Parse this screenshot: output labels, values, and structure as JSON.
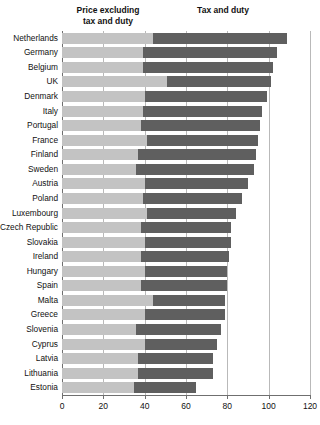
{
  "chart_data": {
    "type": "bar",
    "orientation": "horizontal",
    "stacked": true,
    "title": "",
    "xlabel": "",
    "ylabel": "",
    "xlim": [
      0,
      120
    ],
    "xticks": [
      0,
      20,
      40,
      60,
      80,
      100,
      120
    ],
    "grid": "vertical",
    "legend_position": "top-as-column-headers",
    "colors": {
      "price": "#c3c3c3",
      "tax": "#5f5f5f"
    },
    "series": [
      {
        "name": "Price excluding tax and duty",
        "color": "#c3c3c3",
        "values": [
          44,
          39,
          39,
          51,
          40,
          39,
          38,
          41,
          37,
          36,
          40,
          39,
          41,
          38,
          40,
          38,
          40,
          38,
          44,
          40,
          36,
          40,
          37,
          37,
          35
        ]
      },
      {
        "name": "Tax and duty",
        "color": "#5f5f5f",
        "values": [
          65,
          65,
          63,
          50,
          59,
          58,
          58,
          54,
          57,
          57,
          50,
          48,
          43,
          44,
          42,
          43,
          40,
          42,
          35,
          39,
          41,
          35,
          36,
          36,
          30
        ]
      }
    ],
    "categories": [
      "Netherlands",
      "Germany",
      "Belgium",
      "UK",
      "Denmark",
      "Italy",
      "Portugal",
      "France",
      "Finland",
      "Sweden",
      "Austria",
      "Poland",
      "Luxembourg",
      "Czech Republic",
      "Slovakia",
      "Ireland",
      "Hungary",
      "Spain",
      "Malta",
      "Greece",
      "Slovenia",
      "Cyprus",
      "Latvia",
      "Lithuania",
      "Estonia"
    ],
    "totals": [
      109,
      104,
      102,
      101,
      99,
      97,
      96,
      95,
      94,
      93,
      90,
      87,
      84,
      82,
      82,
      81,
      80,
      80,
      79,
      79,
      77,
      75,
      73,
      73,
      65
    ]
  },
  "headers": {
    "price": "Price excluding\ntax and duty",
    "price_line1": "Price excluding",
    "price_line2": "tax and duty",
    "tax": "Tax and duty"
  },
  "axis": {
    "tick_labels": [
      "0",
      "20",
      "40",
      "60",
      "80",
      "100",
      "120"
    ]
  }
}
